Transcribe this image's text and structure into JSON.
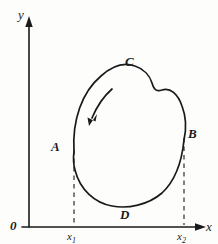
{
  "figure": {
    "type": "line-diagram",
    "background_color": "#fdfdfc",
    "ink_color": "#1a1a1a"
  },
  "axes": {
    "x_axis_label": "x",
    "y_axis_label": "y",
    "origin_label": "0",
    "x_axis_y_px": 227,
    "y_axis_x_px": 29,
    "arrowheads": [
      "x-axis-arrowhead",
      "y-axis-arrowhead"
    ]
  },
  "ticks": [
    {
      "name": "x1",
      "label": "x",
      "subscript": "1",
      "x_px": 74
    },
    {
      "name": "x2",
      "label": "x",
      "subscript": "2",
      "x_px": 184
    }
  ],
  "curve": {
    "name": "closed-cycle-curve",
    "closed": true,
    "direction": "counterclockwise",
    "arrow_name": "direction-arrow"
  },
  "points": [
    {
      "id": "A",
      "label": "A",
      "x_px": 59,
      "y_px": 147,
      "note": "left extreme, above x1"
    },
    {
      "id": "B",
      "label": "B",
      "x_px": 191,
      "y_px": 134,
      "note": "right extreme, above x2"
    },
    {
      "id": "C",
      "label": "C",
      "x_px": 129,
      "y_px": 63,
      "note": "top of curve"
    },
    {
      "id": "D",
      "label": "D",
      "x_px": 124,
      "y_px": 202,
      "note": "bottom of curve"
    }
  ],
  "dashed_guides": [
    {
      "name": "dashed-guide-x1",
      "from_point": "A",
      "to_axis": "x-axis"
    },
    {
      "name": "dashed-guide-x2",
      "from_point": "B",
      "to_axis": "x-axis"
    }
  ]
}
